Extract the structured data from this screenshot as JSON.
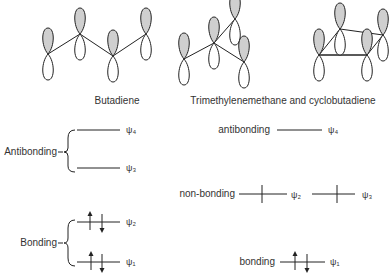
{
  "captions": {
    "butadiene": "Butadiene",
    "tmm_cbd": "Trimethylenemethane and cyclobutadiene"
  },
  "butadiene_levels": {
    "antibonding_label": "Antibonding",
    "bonding_label": "Bonding",
    "psi4": "ψ₄",
    "psi3": "ψ₃",
    "psi2": "ψ₂",
    "psi1": "ψ₁"
  },
  "tmm_levels": {
    "antibonding_label": "antibonding",
    "nonbonding_label": "non-bonding",
    "bonding_label": "bonding",
    "psi4": "ψ₄",
    "psi3": "ψ₃",
    "psi2": "ψ₂",
    "psi1": "ψ₁"
  },
  "colors": {
    "lobe_shaded": "#cfcfcf",
    "line": "#222222",
    "text": "#333333"
  }
}
